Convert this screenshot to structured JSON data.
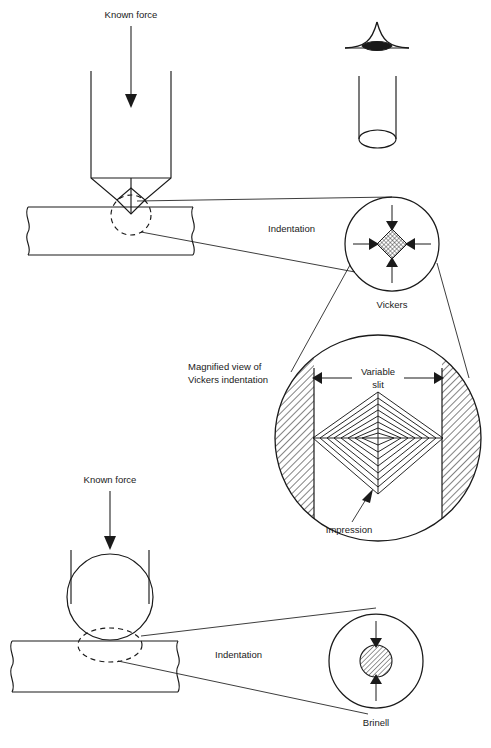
{
  "figure": {
    "background_color": "#ffffff",
    "line_color": "#1a1a1a",
    "hatch_color": "#1a1a1a"
  },
  "labels": {
    "known_force_top": "Known force",
    "known_force_bottom": "Known force",
    "indentation_top": "Indentation",
    "indentation_bottom": "Indentation",
    "vickers": "Vickers",
    "brinell": "Brinell",
    "magnified_view_line1": "Magnified view of",
    "magnified_view_line2": "Vickers indentation",
    "variable_slit_line1": "Variable",
    "variable_slit_line2": "slit",
    "impression": "Impression"
  },
  "sections": {
    "vickers_test": {
      "name": "Vickers hardness test",
      "indenter": "square-pyramid-indenter",
      "specimen": "flat-bar-specimen",
      "detail_callout": "vickers-detail-circle"
    },
    "brinell_test": {
      "name": "Brinell hardness test",
      "indenter": "ball-indenter",
      "specimen": "flat-bar-specimen",
      "detail_callout": "brinell-detail-circle"
    },
    "inset": {
      "name": "pyramid-tip-and-cylinder-inset",
      "parts": [
        "pyramid-tip-apex",
        "cylindrical-shaft"
      ]
    },
    "magnified": {
      "name": "magnified-vickers-indentation",
      "parts": [
        "variable-slit-jaws",
        "diamond-impression",
        "dimension-arrows"
      ]
    }
  }
}
